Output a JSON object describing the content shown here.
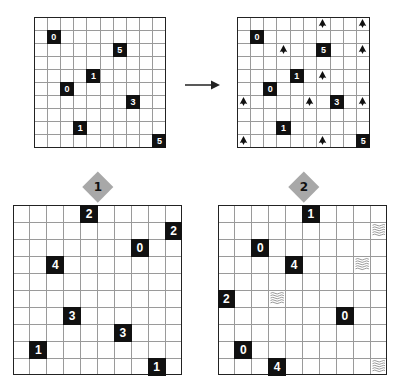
{
  "colors": {
    "grid_line": "#9a9a9a",
    "grid_border": "#222222",
    "clue_bg": "#111111",
    "clue_text": "#ffffff",
    "diamond": "#a8a8a8",
    "ship": "#111111",
    "wave": "#777777"
  },
  "example": {
    "puzzle": {
      "box": {
        "x": 34,
        "y": 17,
        "w": 132,
        "h": 131
      },
      "rows": 10,
      "cols": 10,
      "clues": [
        {
          "r": 1,
          "c": 1,
          "v": "0"
        },
        {
          "r": 2,
          "c": 6,
          "v": "5"
        },
        {
          "r": 4,
          "c": 4,
          "v": "1"
        },
        {
          "r": 5,
          "c": 2,
          "v": "0"
        },
        {
          "r": 6,
          "c": 7,
          "v": "3"
        },
        {
          "r": 8,
          "c": 3,
          "v": "1"
        },
        {
          "r": 9,
          "c": 9,
          "v": "5"
        }
      ]
    },
    "arrow": {
      "icon": "right-arrow-icon"
    },
    "solution": {
      "box": {
        "x": 237,
        "y": 17,
        "w": 133,
        "h": 131
      },
      "rows": 10,
      "cols": 10,
      "clues": [
        {
          "r": 1,
          "c": 1,
          "v": "0"
        },
        {
          "r": 2,
          "c": 6,
          "v": "5"
        },
        {
          "r": 4,
          "c": 4,
          "v": "1"
        },
        {
          "r": 5,
          "c": 2,
          "v": "0"
        },
        {
          "r": 6,
          "c": 7,
          "v": "3"
        },
        {
          "r": 8,
          "c": 3,
          "v": "1"
        },
        {
          "r": 9,
          "c": 9,
          "v": "5"
        }
      ],
      "ships": [
        {
          "r": 0,
          "c": 6
        },
        {
          "r": 0,
          "c": 9
        },
        {
          "r": 2,
          "c": 3
        },
        {
          "r": 2,
          "c": 9
        },
        {
          "r": 4,
          "c": 6
        },
        {
          "r": 6,
          "c": 0
        },
        {
          "r": 6,
          "c": 5
        },
        {
          "r": 6,
          "c": 9
        },
        {
          "r": 9,
          "c": 0
        },
        {
          "r": 9,
          "c": 6
        }
      ]
    }
  },
  "puzzles": [
    {
      "label": "1",
      "diamond": {
        "cx": 98,
        "cy": 187
      },
      "box": {
        "x": 13,
        "y": 205,
        "w": 169,
        "h": 170
      },
      "rows": 10,
      "cols": 10,
      "clues": [
        {
          "r": 0,
          "c": 4,
          "v": "2"
        },
        {
          "r": 1,
          "c": 9,
          "v": "2"
        },
        {
          "r": 2,
          "c": 7,
          "v": "0"
        },
        {
          "r": 3,
          "c": 2,
          "v": "4"
        },
        {
          "r": 6,
          "c": 3,
          "v": "3"
        },
        {
          "r": 7,
          "c": 6,
          "v": "3"
        },
        {
          "r": 8,
          "c": 1,
          "v": "1"
        },
        {
          "r": 9,
          "c": 8,
          "v": "1"
        }
      ],
      "waves": []
    },
    {
      "label": "2",
      "diamond": {
        "cx": 304,
        "cy": 187
      },
      "box": {
        "x": 218,
        "y": 205,
        "w": 169,
        "h": 170
      },
      "rows": 10,
      "cols": 10,
      "clues": [
        {
          "r": 0,
          "c": 5,
          "v": "1"
        },
        {
          "r": 2,
          "c": 2,
          "v": "0"
        },
        {
          "r": 3,
          "c": 4,
          "v": "4"
        },
        {
          "r": 5,
          "c": 0,
          "v": "2"
        },
        {
          "r": 6,
          "c": 7,
          "v": "0"
        },
        {
          "r": 8,
          "c": 1,
          "v": "0"
        },
        {
          "r": 9,
          "c": 3,
          "v": "4"
        }
      ],
      "waves": [
        {
          "r": 1,
          "c": 9
        },
        {
          "r": 3,
          "c": 8
        },
        {
          "r": 5,
          "c": 3
        },
        {
          "r": 9,
          "c": 9
        }
      ]
    }
  ]
}
